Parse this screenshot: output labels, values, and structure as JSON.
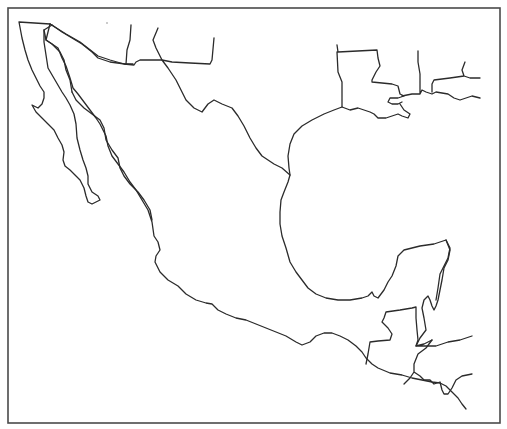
{
  "map": {
    "title": "",
    "type": "blank-outline-map",
    "region": "Mexico, Central America and U.S. Gulf Coast",
    "features": [
      {
        "id": "baja-california-peninsula",
        "kind": "coastline"
      },
      {
        "id": "gulf-of-california-east-coast",
        "kind": "coastline"
      },
      {
        "id": "pacific-coast-mexico",
        "kind": "coastline"
      },
      {
        "id": "gulf-of-mexico-coast",
        "kind": "coastline"
      },
      {
        "id": "yucatan-peninsula",
        "kind": "coastline"
      },
      {
        "id": "us-mexico-border",
        "kind": "border"
      },
      {
        "id": "us-state-borders-west",
        "kind": "border"
      },
      {
        "id": "louisiana-outline",
        "kind": "border"
      },
      {
        "id": "mississippi-alabama-borders",
        "kind": "border"
      },
      {
        "id": "guatemala-belize-borders",
        "kind": "border"
      },
      {
        "id": "honduras-el-salvador-borders",
        "kind": "border"
      }
    ],
    "labels": [],
    "colors": {
      "line": "#2b2b2b",
      "frame": "#4a4a4a",
      "background": "#ffffff"
    }
  }
}
